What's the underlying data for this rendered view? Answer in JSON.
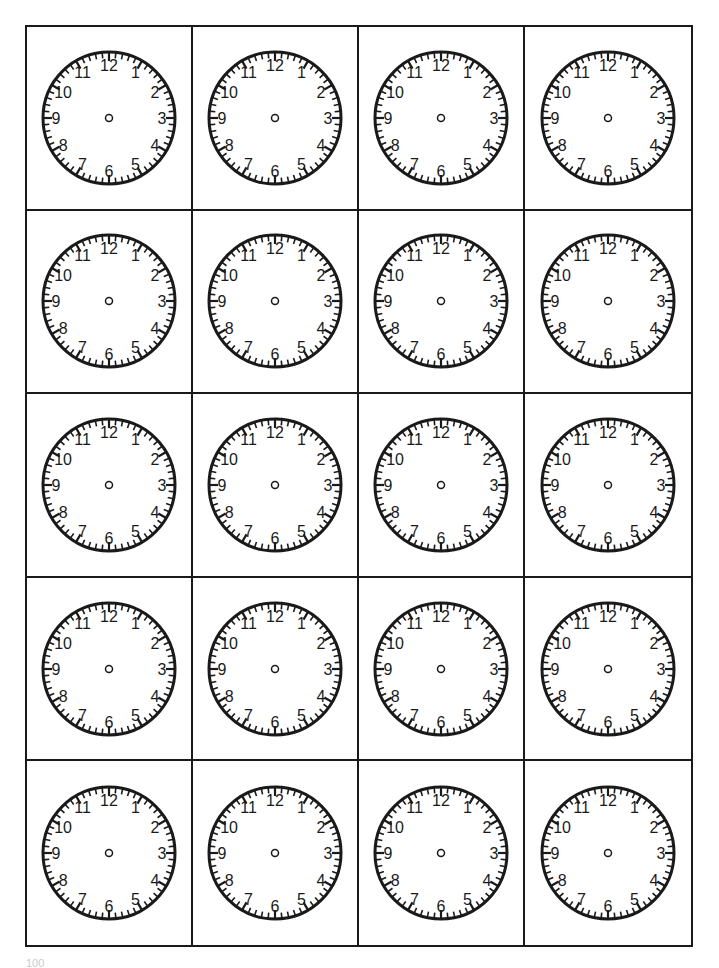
{
  "worksheet": {
    "title": "Blank clock faces",
    "rows": 5,
    "columns": 4,
    "clock_numbers": [
      "12",
      "1",
      "2",
      "3",
      "4",
      "5",
      "6",
      "7",
      "8",
      "9",
      "10",
      "11"
    ],
    "page_number": "100",
    "colors": {
      "line": "#1a1a1a",
      "background": "#ffffff"
    }
  }
}
